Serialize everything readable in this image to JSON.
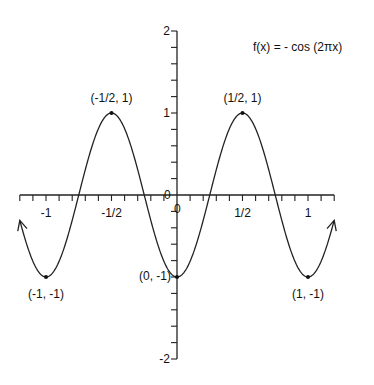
{
  "chart_data": {
    "type": "line",
    "title": "f(x) = - cos (2πx)",
    "function": "-cos(2*pi*x)",
    "xlabel": "",
    "ylabel": "",
    "xlim": [
      -1.2,
      1.2
    ],
    "ylim": [
      -2,
      2
    ],
    "grid": false,
    "legend": null,
    "x_ticks": [
      {
        "value": -1,
        "label": "-1"
      },
      {
        "value": -0.5,
        "label": "-1/2"
      },
      {
        "value": 0.5,
        "label": "1/2"
      },
      {
        "value": 1,
        "label": "1"
      }
    ],
    "x_minor_step": 0.1,
    "y_ticks": [
      {
        "value": 2,
        "label": "2"
      },
      {
        "value": 1,
        "label": "1"
      },
      {
        "value": -2,
        "label": "-2"
      }
    ],
    "y_minor_step": 0.2,
    "origin_labels": [
      "0",
      "0"
    ],
    "series": [
      {
        "name": "f(x) = -cos(2πx)",
        "x": [
          -1.2,
          -1.1,
          -1.0,
          -0.9,
          -0.8,
          -0.7,
          -0.6,
          -0.5,
          -0.4,
          -0.3,
          -0.2,
          -0.1,
          0.0,
          0.1,
          0.2,
          0.3,
          0.4,
          0.5,
          0.6,
          0.7,
          0.8,
          0.9,
          1.0,
          1.1,
          1.2
        ],
        "y": [
          -0.309,
          -0.809,
          -1.0,
          -0.809,
          -0.309,
          0.309,
          0.809,
          1.0,
          0.809,
          0.309,
          -0.309,
          -0.809,
          -1.0,
          -0.809,
          -0.309,
          0.309,
          0.809,
          1.0,
          0.809,
          0.309,
          -0.309,
          -0.809,
          -1.0,
          -0.809,
          -0.309
        ]
      }
    ],
    "annotations": [
      {
        "x": -1,
        "y": -1,
        "label": "(-1, -1)",
        "pos": "below"
      },
      {
        "x": -0.5,
        "y": 1,
        "label": "(-1/2, 1)",
        "pos": "above"
      },
      {
        "x": 0,
        "y": -1,
        "label": "(0, -1)",
        "pos": "left"
      },
      {
        "x": 0.5,
        "y": 1,
        "label": "(1/2, 1)",
        "pos": "above"
      },
      {
        "x": 1,
        "y": -1,
        "label": "(1, -1)",
        "pos": "below"
      }
    ],
    "arrows": [
      "both-ends"
    ]
  }
}
